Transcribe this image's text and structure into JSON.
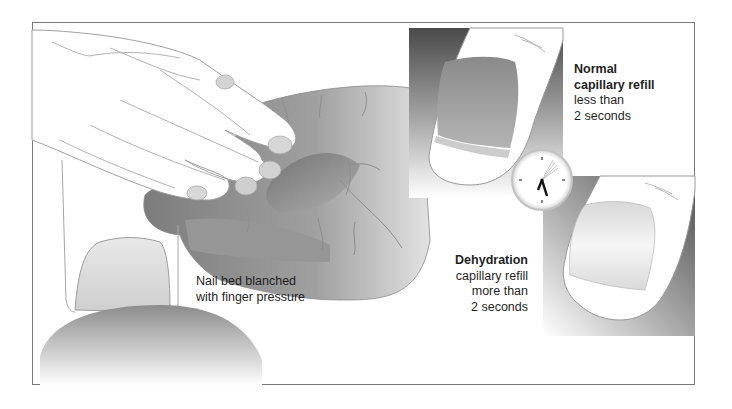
{
  "figure": {
    "panels": {
      "blanch": {
        "caption_line1": "Nail bed blanched",
        "caption_line2": "with finger pressure"
      },
      "normal": {
        "heading_line1": "Normal",
        "heading_line2": "capillary refill",
        "detail_line1": "less than",
        "detail_line2": "2 seconds"
      },
      "dehydration": {
        "heading": "Dehydration",
        "detail_line1": "capillary refill",
        "detail_line2": "more than",
        "detail_line3": "2 seconds"
      }
    },
    "icons": {
      "clock": "clock-icon",
      "hand": "hand-illustration",
      "fingernail_normal": "fingernail-pink",
      "fingernail_blanched": "fingernail-pale"
    },
    "colors": {
      "frame_border": "#7a7a7a",
      "skin_shade": "#8f8f8f",
      "panel_dark": "#5a5a5a",
      "text": "#1f1f1f"
    }
  }
}
